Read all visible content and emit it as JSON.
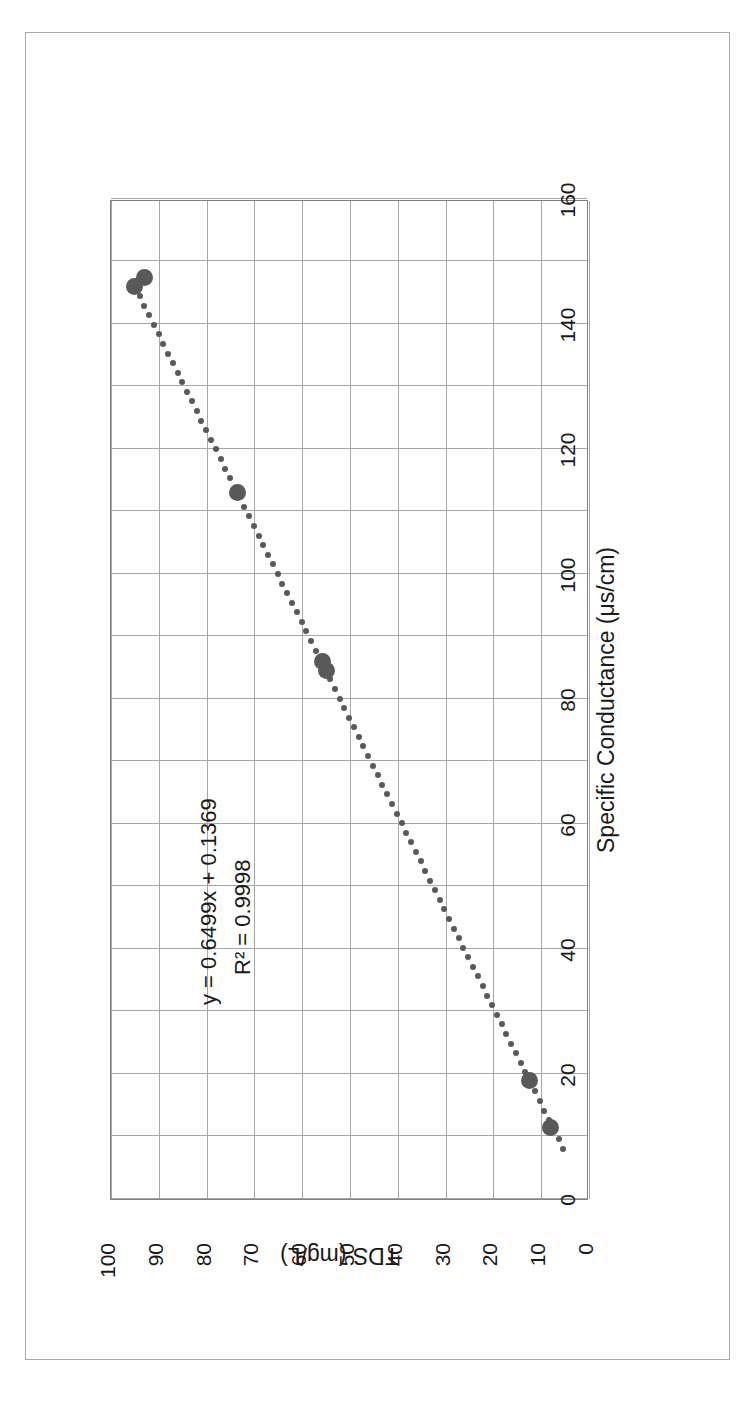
{
  "chart_data": {
    "type": "scatter",
    "title": "",
    "xlabel": "Specific Conductance (μs/cm)",
    "ylabel": "TDS (mg/L)",
    "xlim": [
      0,
      160
    ],
    "ylim": [
      0,
      100
    ],
    "xticks": [
      0,
      20,
      40,
      60,
      80,
      100,
      120,
      140,
      160
    ],
    "yticks": [
      0,
      10,
      20,
      30,
      40,
      50,
      60,
      70,
      80,
      90,
      100
    ],
    "x_minor_step": 10,
    "y_minor_step": 10,
    "grid": true,
    "legend": "none",
    "series": [
      {
        "name": "TDS vs Specific Conductance",
        "marker_color": "#595959",
        "points": [
          {
            "x": 11.5,
            "y": 8.0
          },
          {
            "x": 19.0,
            "y": 12.4
          },
          {
            "x": 84.5,
            "y": 55.0
          },
          {
            "x": 86.0,
            "y": 55.8
          },
          {
            "x": 113.0,
            "y": 73.5
          },
          {
            "x": 146.0,
            "y": 95.0
          },
          {
            "x": 147.5,
            "y": 93.0
          }
        ]
      }
    ],
    "trendline": {
      "type": "linear-dotted",
      "color": "#595959",
      "slope": 0.6499,
      "intercept": 0.1369,
      "x_start": 8,
      "x_end": 146
    },
    "annotations": {
      "equation": "y = 0.6499x + 0.1369",
      "r_squared": "R² = 0.9998"
    }
  },
  "page": {
    "orientation": "rotated-90-ccw",
    "border_color": "#a9a9a9",
    "background": "#ffffff"
  }
}
